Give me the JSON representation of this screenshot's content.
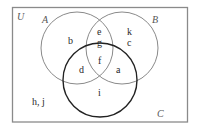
{
  "diagram": {
    "type": "venn",
    "universe_label": "U",
    "sets": [
      {
        "label": "A",
        "stroke": "#8a8a8a"
      },
      {
        "label": "B",
        "stroke": "#8a8a8a"
      },
      {
        "label": "C",
        "stroke": "#222222"
      }
    ],
    "regions": {
      "A_only": "b",
      "A_and_B_only": "e",
      "A_and_B_only_2": "g",
      "B_only_1": "k",
      "B_only_2": "c",
      "A_B_C": "f",
      "A_and_C_only": "d",
      "B_and_C_only": "a",
      "C_only": "i",
      "outside": "h, j"
    },
    "colors": {
      "frame": "#8a8a8a",
      "background": "#ffffff"
    }
  }
}
